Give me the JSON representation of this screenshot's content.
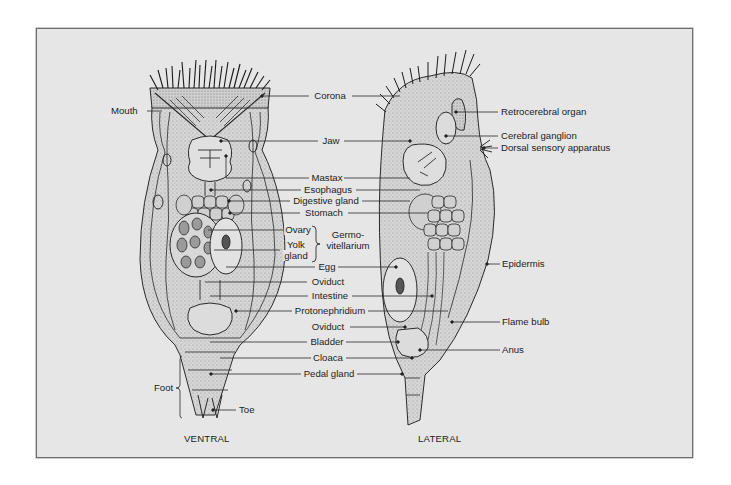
{
  "figure": {
    "views": {
      "ventral": "VENTRAL",
      "lateral": "LATERAL"
    },
    "left_labels": {
      "mouth": "Mouth",
      "foot": "Foot",
      "toe": "Toe"
    },
    "center_labels": {
      "corona": "Corona",
      "jaw": "Jaw",
      "mastax": "Mastax",
      "esophagus": "Esophagus",
      "digestive_gland": "Digestive gland",
      "stomach": "Stomach",
      "ovary": "Ovary",
      "yolk_gland_1": "Yolk",
      "yolk_gland_2": "gland",
      "germovitellarium_1": "Germo-",
      "germovitellarium_2": "vitellarium",
      "egg": "Egg",
      "oviduct": "Oviduct",
      "intestine": "Intestine",
      "protonephridium": "Protonephridium",
      "oviduct_2": "Oviduct",
      "bladder": "Bladder",
      "cloaca": "Cloaca",
      "pedal_gland": "Pedal gland"
    },
    "right_labels": {
      "retrocerebral_organ": "Retrocerebral organ",
      "cerebral_ganglion": "Cerebral ganglion",
      "dorsal_sensory_apparatus": "Dorsal sensory apparatus",
      "epidermis": "Epidermis",
      "flame_bulb": "Flame bulb",
      "anus": "Anus"
    },
    "colors": {
      "panel_bg": "#e6e6e6",
      "ink": "#1c1c1c",
      "stipple": "#c9c9c9"
    }
  }
}
